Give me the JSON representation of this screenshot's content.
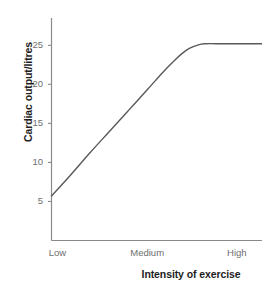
{
  "chart_data": {
    "type": "line",
    "title": "",
    "subtitle": "",
    "xlabel": "Intensity of exercise",
    "ylabel": "Cardiac output/litres",
    "grid": false,
    "legend": null,
    "ylim": [
      0,
      28.5
    ],
    "yticks": [
      5,
      10,
      15,
      20,
      25
    ],
    "ytick_labels": [
      "5",
      "10",
      "15",
      "20",
      "25"
    ],
    "xtick_labels": [
      "Low",
      "Medium",
      "High"
    ],
    "xtick_positions": [
      0.0,
      0.5,
      1.0
    ],
    "xlim": [
      0,
      1.1
    ],
    "series": [
      {
        "name": "Cardiac output",
        "color": "#595959",
        "linewidth": 1.4,
        "points": [
          {
            "x": 0.0,
            "y": 5.7
          },
          {
            "x": 0.1,
            "y": 8.4
          },
          {
            "x": 0.2,
            "y": 11.2
          },
          {
            "x": 0.3,
            "y": 13.9
          },
          {
            "x": 0.4,
            "y": 16.6
          },
          {
            "x": 0.5,
            "y": 19.3
          },
          {
            "x": 0.58,
            "y": 21.5
          },
          {
            "x": 0.64,
            "y": 23.0
          },
          {
            "x": 0.68,
            "y": 23.9
          },
          {
            "x": 0.72,
            "y": 24.6
          },
          {
            "x": 0.76,
            "y": 25.0
          },
          {
            "x": 0.8,
            "y": 25.2
          },
          {
            "x": 0.9,
            "y": 25.2
          },
          {
            "x": 1.0,
            "y": 25.2
          },
          {
            "x": 1.1,
            "y": 25.2
          }
        ],
        "annotation": "Linear rise from rest, plateau at maximum cardiac output"
      }
    ],
    "plateau_value": 25.2,
    "start_value": 5.7
  },
  "axes": {
    "axis_color": "#8a8a8a",
    "tick_color": "#8a8a8a",
    "label_color": "#6e6e6e",
    "title_color": "#1d1d1d"
  },
  "background": {
    "page_color": "#ffffff",
    "plot_color": "#ffffff"
  }
}
